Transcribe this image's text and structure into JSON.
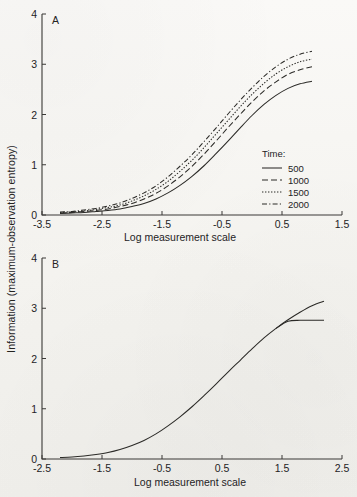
{
  "figure": {
    "y_axis_label": "Information (maximum-observation entropy)",
    "panels": [
      {
        "label": "A",
        "xlabel": "Log measurement scale",
        "xticks": [
          "-3.5",
          "-2.5",
          "-1.5",
          "-0.5",
          "0.5",
          "1.5"
        ],
        "yticks": [
          "0",
          "1",
          "2",
          "3",
          "4"
        ],
        "legend": {
          "title": "Time:",
          "entries": [
            {
              "label": "500",
              "style": "solid"
            },
            {
              "label": "1000",
              "style": "dashed"
            },
            {
              "label": "1500",
              "style": "dotted"
            },
            {
              "label": "2000",
              "style": "dashdot"
            }
          ]
        }
      },
      {
        "label": "B",
        "xlabel": "Log measurement scale",
        "xticks": [
          "-2.5",
          "-1.5",
          "-0.5",
          "0.5",
          "1.5",
          "2.5"
        ],
        "yticks": [
          "0",
          "1",
          "2",
          "3",
          "4"
        ]
      }
    ]
  },
  "chart_data": [
    {
      "type": "line",
      "panel": "A",
      "title": "",
      "xlabel": "Log measurement scale",
      "ylabel": "Information (maximum-observation entropy)",
      "xlim": [
        -3.5,
        1.5
      ],
      "ylim": [
        0,
        4
      ],
      "xticks": [
        -3.5,
        -2.5,
        -1.5,
        -0.5,
        0.5,
        1.5
      ],
      "yticks": [
        0,
        1,
        2,
        3,
        4
      ],
      "grid": false,
      "legend_position": "right-inside",
      "legend_title": "Time:",
      "x": [
        -3.2,
        -3.0,
        -2.8,
        -2.6,
        -2.4,
        -2.2,
        -2.0,
        -1.8,
        -1.6,
        -1.4,
        -1.2,
        -1.0,
        -0.8,
        -0.6,
        -0.4,
        -0.2,
        0.0,
        0.2,
        0.4,
        0.6,
        0.8,
        1.0
      ],
      "series": [
        {
          "name": "500",
          "style": "solid",
          "values": [
            0.03,
            0.04,
            0.05,
            0.07,
            0.09,
            0.12,
            0.17,
            0.23,
            0.32,
            0.44,
            0.59,
            0.77,
            0.98,
            1.22,
            1.47,
            1.73,
            1.98,
            2.2,
            2.38,
            2.52,
            2.61,
            2.66
          ]
        },
        {
          "name": "1000",
          "style": "dashed",
          "values": [
            0.04,
            0.05,
            0.07,
            0.09,
            0.12,
            0.17,
            0.23,
            0.32,
            0.43,
            0.58,
            0.76,
            0.97,
            1.21,
            1.47,
            1.74,
            2.0,
            2.25,
            2.47,
            2.65,
            2.8,
            2.89,
            2.95
          ]
        },
        {
          "name": "1500",
          "style": "dotted",
          "values": [
            0.05,
            0.06,
            0.08,
            0.11,
            0.15,
            0.2,
            0.28,
            0.38,
            0.51,
            0.67,
            0.87,
            1.09,
            1.34,
            1.61,
            1.88,
            2.15,
            2.4,
            2.62,
            2.81,
            2.95,
            3.05,
            3.1
          ]
        },
        {
          "name": "2000",
          "style": "dashdot",
          "values": [
            0.06,
            0.07,
            0.1,
            0.13,
            0.18,
            0.24,
            0.33,
            0.44,
            0.58,
            0.76,
            0.97,
            1.2,
            1.46,
            1.73,
            2.01,
            2.28,
            2.53,
            2.76,
            2.95,
            3.1,
            3.2,
            3.26
          ]
        }
      ]
    },
    {
      "type": "line",
      "panel": "B",
      "title": "",
      "xlabel": "Log measurement scale",
      "ylabel": "Information (maximum-observation entropy)",
      "xlim": [
        -2.5,
        2.5
      ],
      "ylim": [
        0,
        4
      ],
      "xticks": [
        -2.5,
        -1.5,
        -0.5,
        0.5,
        1.5,
        2.5
      ],
      "yticks": [
        0,
        1,
        2,
        3,
        4
      ],
      "grid": false,
      "legend_position": "none",
      "note": "curves for all four times collapse onto a single common curve after rescaling",
      "x": [
        -2.2,
        -2.0,
        -1.8,
        -1.6,
        -1.4,
        -1.2,
        -1.0,
        -0.8,
        -0.6,
        -0.4,
        -0.2,
        0.0,
        0.2,
        0.4,
        0.6,
        0.8,
        1.0,
        1.2,
        1.4,
        1.6,
        1.8,
        2.0,
        2.2
      ],
      "series": [
        {
          "name": "collapsed",
          "style": "solid",
          "values": [
            0.03,
            0.04,
            0.06,
            0.09,
            0.13,
            0.19,
            0.27,
            0.37,
            0.5,
            0.66,
            0.84,
            1.04,
            1.26,
            1.49,
            1.73,
            1.96,
            2.19,
            2.41,
            2.6,
            2.77,
            2.92,
            3.05,
            3.14
          ]
        },
        {
          "name": "branch-500",
          "style": "solid",
          "values": [
            null,
            null,
            null,
            null,
            null,
            null,
            null,
            null,
            null,
            null,
            null,
            null,
            null,
            null,
            null,
            null,
            null,
            null,
            2.6,
            2.74,
            2.76,
            2.76,
            2.76
          ]
        }
      ]
    }
  ]
}
